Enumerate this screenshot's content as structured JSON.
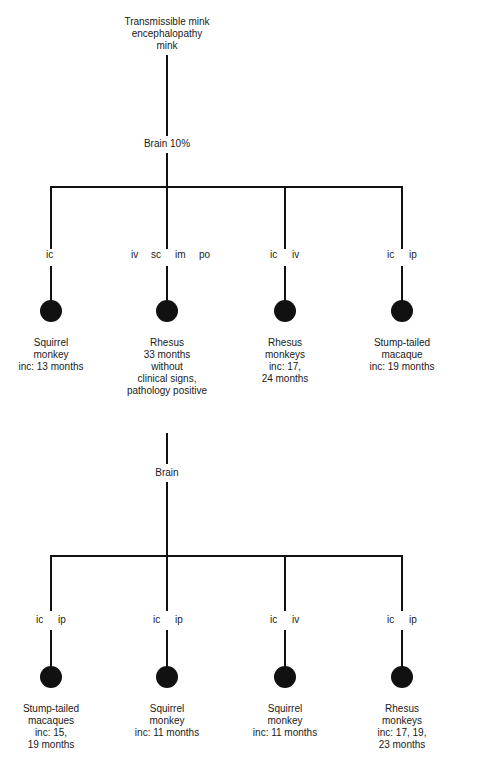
{
  "source": {
    "lines": [
      "Transmissible mink",
      "encephalopathy",
      "mink"
    ]
  },
  "passage1": {
    "inoculum": "Brain 10%",
    "branches": [
      {
        "routes": [
          "ic"
        ],
        "animal_lines": [
          "Squirrel",
          "monkey",
          "inc:  13 months"
        ]
      },
      {
        "routes": [
          "iv",
          "sc",
          "im",
          "po"
        ],
        "animal_lines": [
          "Rhesus",
          "33 months",
          "without",
          "clinical signs,",
          "pathology positive"
        ]
      },
      {
        "routes": [
          "ic",
          "iv"
        ],
        "animal_lines": [
          "Rhesus",
          "monkeys",
          "inc:  17,",
          "24 months"
        ]
      },
      {
        "routes": [
          "ic",
          "ip"
        ],
        "animal_lines": [
          "Stump-tailed",
          "macaque",
          "inc:  19 months"
        ]
      }
    ]
  },
  "passage2": {
    "inoculum": "Brain",
    "branches": [
      {
        "routes": [
          "ic",
          "ip"
        ],
        "animal_lines": [
          "Stump-tailed",
          "macaques",
          "inc:  15,",
          "19 months"
        ]
      },
      {
        "routes": [
          "ic",
          "ip"
        ],
        "animal_lines": [
          "Squirrel",
          "monkey",
          "inc:  11 months"
        ]
      },
      {
        "routes": [
          "ic",
          "iv"
        ],
        "animal_lines": [
          "Squirrel",
          "monkey",
          "inc:  11 months"
        ]
      },
      {
        "routes": [
          "ic",
          "ip"
        ],
        "animal_lines": [
          "Rhesus",
          "monkeys",
          "inc:  17, 19,",
          "23 months"
        ]
      }
    ]
  },
  "colors": {
    "line": "#111111",
    "node": "#111111",
    "background": "#ffffff"
  }
}
